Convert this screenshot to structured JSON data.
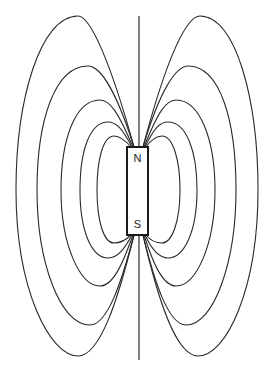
{
  "diagram": {
    "magnet": {
      "north_label": "N",
      "south_label": "S",
      "x": 127,
      "y": 147,
      "width": 21,
      "height": 88
    },
    "axis": {
      "x": 139,
      "y_top": 16,
      "y_bottom": 360
    },
    "colors": {
      "line": "#2a2a2a",
      "background": "#ffffff"
    },
    "field_line_count_per_side": 5
  }
}
